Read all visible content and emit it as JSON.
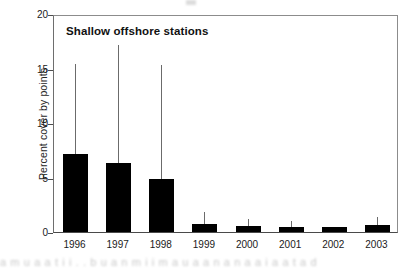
{
  "chart_data": {
    "type": "bar",
    "title": "Shallow offshore stations",
    "xlabel": "",
    "ylabel": "Percent cover by points",
    "categories": [
      "1996",
      "1997",
      "1998",
      "1999",
      "2000",
      "2001",
      "2002",
      "2003"
    ],
    "values": [
      7.2,
      6.3,
      4.9,
      0.7,
      0.55,
      0.5,
      0.5,
      0.6
    ],
    "error_upper": [
      15.4,
      17.2,
      15.3,
      1.8,
      1.2,
      1.0,
      0.5,
      1.4
    ],
    "ylim": [
      0,
      20
    ],
    "yticks": [
      0,
      5,
      10,
      15,
      20
    ],
    "ytick_labels": [
      "0",
      "5",
      "10",
      "15",
      "20"
    ],
    "grid": false,
    "legend": null,
    "bar_color": "#000000",
    "error_color": "#6b6b6b",
    "axis_color": "#4a4a4a"
  },
  "caption": {
    "text": "a m u a a t i i . . b u a n m   i i m   a u a   a n a n a   a i a a t a d"
  }
}
